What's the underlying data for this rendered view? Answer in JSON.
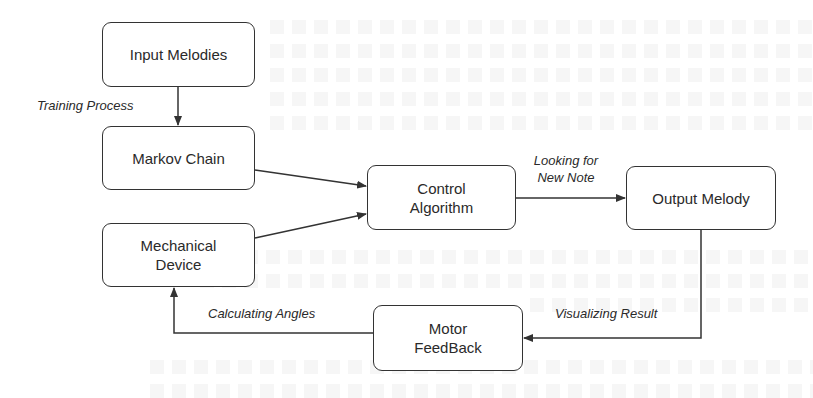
{
  "diagram": {
    "nodes": [
      {
        "id": "input",
        "label_lines": [
          "Input Melodies"
        ]
      },
      {
        "id": "markov",
        "label_lines": [
          "Markov Chain"
        ]
      },
      {
        "id": "mechanical",
        "label_lines": [
          "Mechanical",
          "Device"
        ]
      },
      {
        "id": "control",
        "label_lines": [
          "Control",
          "Algorithm"
        ]
      },
      {
        "id": "output",
        "label_lines": [
          "Output Melody"
        ]
      },
      {
        "id": "motor",
        "label_lines": [
          "Motor",
          "FeedBack"
        ]
      }
    ],
    "edges": [
      {
        "from": "input",
        "to": "markov",
        "label_lines": [
          "Training Process"
        ]
      },
      {
        "from": "markov",
        "to": "control",
        "label_lines": []
      },
      {
        "from": "mechanical",
        "to": "control",
        "label_lines": []
      },
      {
        "from": "control",
        "to": "output",
        "label_lines": [
          "Looking for",
          "New Note"
        ]
      },
      {
        "from": "output",
        "to": "motor",
        "label_lines": [
          "Visualizing Result"
        ]
      },
      {
        "from": "motor",
        "to": "mechanical",
        "label_lines": [
          "Calculating Angles"
        ]
      }
    ],
    "colors": {
      "stroke": "#333333",
      "text": "#2a2a2a",
      "background": "#ffffff"
    }
  }
}
